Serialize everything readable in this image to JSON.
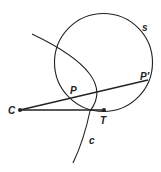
{
  "diagram": {
    "labels": {
      "s": "s",
      "c": "c",
      "C": "C",
      "P": "P",
      "P_prime": "P′",
      "T": "T"
    },
    "colors": {
      "stroke": "#222222",
      "background": "#ffffff"
    }
  }
}
